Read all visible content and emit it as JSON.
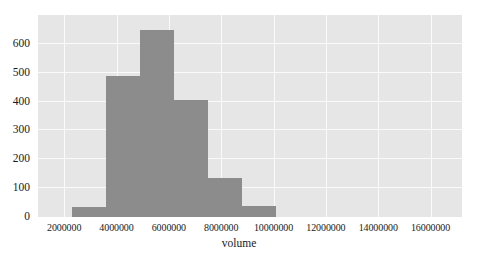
{
  "figure": {
    "top_strip_fragments": [
      "",
      "",
      ""
    ],
    "background_color": "#ffffff",
    "plot_background_color": "#e6e6e6",
    "gridline_color": "#fafafa",
    "bar_color": "#8c8c8c"
  },
  "chart_data": {
    "type": "bar",
    "title": "",
    "xlabel": "volume",
    "ylabel": "",
    "grid": true,
    "legend": "none",
    "xlim": [
      1000000,
      17200000
    ],
    "ylim": [
      0,
      700
    ],
    "xticks": [
      2000000,
      4000000,
      6000000,
      8000000,
      10000000,
      12000000,
      14000000,
      16000000
    ],
    "xtick_labels": [
      "2000000",
      "4000000",
      "6000000",
      "8000000",
      "10000000",
      "12000000",
      "14000000",
      "16000000"
    ],
    "yticks": [
      0,
      100,
      200,
      300,
      400,
      500,
      600
    ],
    "ytick_labels": [
      "0",
      "100",
      "200",
      "300",
      "400",
      "500",
      "600"
    ],
    "bins": [
      {
        "left": 2290000,
        "right": 3590000,
        "value": 35
      },
      {
        "left": 3590000,
        "right": 4890000,
        "value": 490
      },
      {
        "left": 4890000,
        "right": 6190000,
        "value": 648
      },
      {
        "left": 6190000,
        "right": 7490000,
        "value": 405
      },
      {
        "left": 7490000,
        "right": 8790000,
        "value": 135
      },
      {
        "left": 8790000,
        "right": 10090000,
        "value": 38
      }
    ],
    "categories": [
      "2.29M–3.59M",
      "3.59M–4.89M",
      "4.89M–6.19M",
      "6.19M–7.49M",
      "7.49M–8.79M",
      "8.79M–10.09M"
    ],
    "values": [
      35,
      490,
      648,
      405,
      135,
      38
    ]
  }
}
